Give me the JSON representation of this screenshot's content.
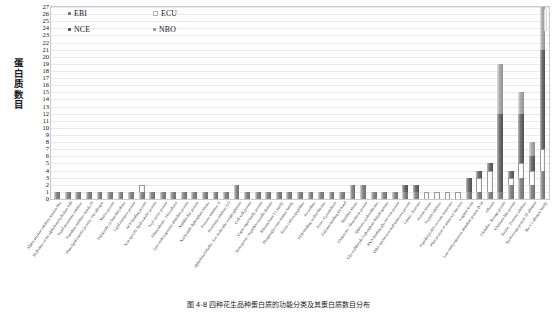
{
  "chart_data": {
    "type": "bar",
    "subtype": "stacked-vertical",
    "title": "",
    "xlabel": "",
    "ylabel": "蛋白质数目",
    "ylim": [
      0,
      27
    ],
    "ytick_step": 1,
    "grid": true,
    "legend_position": "top-left-inside",
    "series": [
      {
        "name": "EBI",
        "color": "#7c7c7c"
      },
      {
        "name": "ECU",
        "color": "#ffffff"
      },
      {
        "name": "NCE",
        "color": "#565656"
      },
      {
        "name": "NBO",
        "color": "#9d9d9d"
      }
    ],
    "yticks": [
      27,
      26,
      25,
      24,
      23,
      22,
      21,
      20,
      19,
      18,
      17,
      16,
      15,
      14,
      13,
      12,
      11,
      10,
      9,
      8,
      7,
      6,
      5,
      4,
      3,
      2,
      1,
      0
    ],
    "categories": [
      "Alpha-amylase inhibitor knottin-like",
      "Hydrolase of the alpha/beta hydrolase fold",
      "Kazal proteinase inhibitor",
      "Peptidase inhibitor family I9",
      "Plant lipid transfer protein / Par allergen",
      "Matrix protein",
      "Polyketide cyclase/dehydrase",
      "Lipid transport protein",
      "ACP-binding protein",
      "Non-specific lipid transfer protein",
      "Acyl carrier protein",
      "Glutaredoxin / Thioredoxin",
      "Late embryogenesis abundant protein",
      "Nodulin-like protein",
      "Nucleoside diphosphate kinase",
      "Protease inhibitor II",
      "Proteinase inhibitor I13",
      "alpha/beta-Gliadin / low molecular weight glutenin",
      "Cell wall protein",
      "Cupin superfamily protein",
      "Hemopexin / Peptidase metallo domain",
      "Ribonuclease T2 family",
      "Phosphoglycerate mutase family",
      "Serine carboxypeptidase",
      "Peroxidase",
      "FAD-binding oxidoreductase",
      "Actin / Cytoskeleton",
      "Calcium-binding EF-hand",
      "Histidine kinase",
      "Chaperone / Heat shock protein",
      "Quinone oxidoreductase",
      "Glyceraldehyde-3-phosphate dehydrogenase",
      "RNA-binding glycine-rich protein",
      "Other uncharacterized/unknown protein",
      "Lipase / Esterase",
      "Protein kinase",
      "Trypsin inhibitor",
      "Peptidyl-prolyl cis-trans isomerase",
      "Plant protein of unknown function",
      "Legume lectin",
      "Late embryogenesis abundant protein D-34",
      "Oleosin",
      "Globulin / Storage protein",
      "Chitinase-like protein",
      "Serpin / Protease inhibitor",
      "Seed storage protein 2S albumin",
      "Bet v 1 allergen family"
    ],
    "values": {
      "EBI": [
        1,
        1,
        1,
        1,
        1,
        1,
        1,
        1,
        1,
        1,
        1,
        1,
        1,
        1,
        1,
        1,
        1,
        2,
        1,
        1,
        1,
        1,
        1,
        1,
        1,
        1,
        1,
        1,
        2,
        2,
        1,
        1,
        1,
        1,
        1,
        0,
        0,
        0,
        0,
        1,
        1,
        1,
        1,
        2,
        3,
        2,
        4
      ],
      "ECU": [
        0,
        0,
        0,
        0,
        0,
        0,
        0,
        0,
        1,
        0,
        0,
        0,
        0,
        0,
        0,
        0,
        0,
        0,
        0,
        0,
        0,
        0,
        0,
        0,
        0,
        0,
        0,
        0,
        0,
        0,
        0,
        0,
        0,
        0,
        0,
        1,
        1,
        1,
        1,
        0,
        2,
        3,
        0,
        1,
        2,
        2,
        3
      ],
      "NCE": [
        0,
        0,
        0,
        0,
        0,
        0,
        0,
        0,
        0,
        0,
        0,
        0,
        0,
        0,
        0,
        0,
        0,
        0,
        0,
        0,
        0,
        0,
        0,
        0,
        0,
        0,
        0,
        0,
        0,
        0,
        0,
        0,
        0,
        1,
        1,
        0,
        0,
        0,
        0,
        2,
        1,
        1,
        11,
        1,
        7,
        2,
        14
      ],
      "NBO": [
        0,
        0,
        0,
        0,
        0,
        0,
        0,
        0,
        0,
        0,
        0,
        0,
        0,
        0,
        0,
        0,
        0,
        0,
        0,
        0,
        0,
        0,
        0,
        0,
        0,
        0,
        0,
        0,
        0,
        0,
        0,
        0,
        0,
        0,
        0,
        0,
        0,
        0,
        0,
        0,
        0,
        0,
        7,
        0,
        3,
        2,
        6
      ]
    },
    "totals": [
      1,
      1,
      1,
      1,
      1,
      1,
      1,
      1,
      2,
      1,
      1,
      1,
      1,
      1,
      1,
      1,
      1,
      2,
      1,
      1,
      1,
      1,
      1,
      1,
      1,
      1,
      1,
      1,
      2,
      2,
      1,
      1,
      1,
      2,
      2,
      1,
      1,
      1,
      1,
      3,
      4,
      5,
      19,
      4,
      15,
      8,
      27
    ]
  },
  "legend": {
    "items": [
      {
        "label": "EBI",
        "key": "EBI"
      },
      {
        "label": "ECU",
        "key": "ECU"
      },
      {
        "label": "NCE",
        "key": "NCE"
      },
      {
        "label": "NBO",
        "key": "NBO"
      }
    ]
  },
  "caption": {
    "text": "图 4-8  四种花生品种蛋白质的功能分类及其蛋白质数目分布"
  }
}
